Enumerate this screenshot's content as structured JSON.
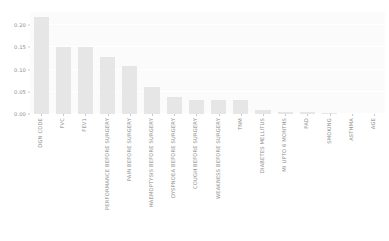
{
  "chart_data": {
    "type": "bar",
    "title": "",
    "subtitle": "",
    "xlabel": "",
    "ylabel": "",
    "ylim": [
      0.0,
      0.23
    ],
    "yticks": [
      0.0,
      0.05,
      0.1,
      0.15,
      0.2
    ],
    "ytick_labels": [
      "0.00",
      "0.05",
      "0.10",
      "0.15",
      "0.20"
    ],
    "grid": true,
    "grid_axis": "y",
    "legend": null,
    "legend_position": "none",
    "orientation": "vertical",
    "bar_color": "#e6e6e6",
    "plot_background": "#fbfbfb",
    "figure_background": "#ffffff",
    "tick_label_color": "#8d8d8d",
    "categories": [
      "DGN CODE",
      "FVC",
      "FEV1",
      "PERFORMANCE BEFORE SURGERY",
      "PAIN BEFORE SURGERY",
      "HAEMOPTYSIS BEFORE SURGERY",
      "DYSPNOEA BEFORE SURGERY",
      "COUGH BEFORE SURGERY",
      "WEAKNESS BEFORE SURGERY",
      "TNM",
      "DIABETES MELLITUS",
      "MI UPTO 6 MONTHS",
      "PAD",
      "SMOKING",
      "ASTHMA",
      "AGE"
    ],
    "values": [
      0.218,
      0.152,
      0.152,
      0.128,
      0.108,
      0.06,
      0.038,
      0.031,
      0.031,
      0.031,
      0.008,
      0.005,
      0.004,
      0.003,
      0.0,
      0.0
    ]
  }
}
